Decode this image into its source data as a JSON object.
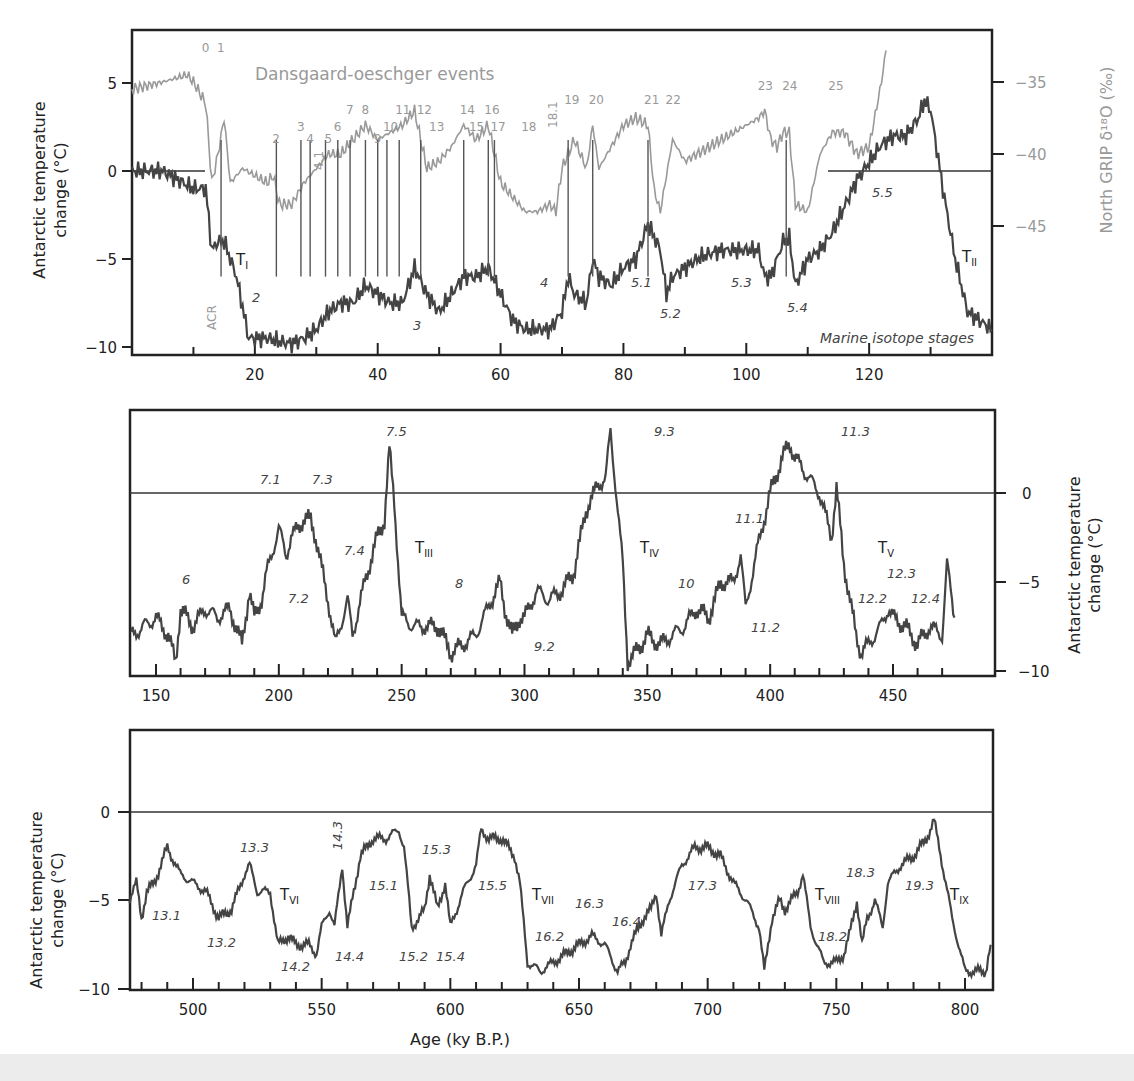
{
  "chart_data": [
    {
      "type": "line",
      "panel": "top",
      "title": "",
      "annotation_title": "Dansgaard-oeschger events",
      "xlabel": "",
      "ylabel": "Antarctic temperature change (°C)",
      "y2label": "North GRIP δ18O (‰)",
      "xlim": [
        0,
        140
      ],
      "ylim": [
        -10.5,
        8
      ],
      "y2lim": [
        -54,
        -30
      ],
      "xticks": [
        20,
        40,
        60,
        80,
        100,
        120
      ],
      "yticks": [
        5,
        0,
        -5,
        -10
      ],
      "y2ticks": [
        -35,
        -40,
        -45
      ],
      "series": [
        {
          "name": "Antarctic temperature",
          "color": "#444444",
          "x": [
            0,
            5,
            10,
            12,
            13,
            14,
            15,
            17,
            19,
            20,
            22,
            24,
            26,
            28,
            30,
            32,
            34,
            36,
            38,
            40,
            42,
            44,
            46,
            48,
            50,
            52,
            54,
            56,
            58,
            60,
            62,
            64,
            66,
            68,
            70,
            71,
            72,
            74,
            75,
            76,
            78,
            80,
            82,
            84,
            86,
            87,
            88,
            90,
            92,
            94,
            96,
            98,
            100,
            102,
            103,
            104,
            106,
            107,
            108,
            110,
            112,
            114,
            116,
            118,
            120,
            122,
            124,
            126,
            128,
            129,
            130,
            132,
            134,
            136,
            138,
            140
          ],
          "y": [
            0,
            0,
            -1,
            -1,
            -4.5,
            -4,
            -4,
            -6,
            -9.5,
            -9.5,
            -9.5,
            -9.7,
            -9.8,
            -9.5,
            -9,
            -8,
            -7.5,
            -7.5,
            -6.5,
            -7,
            -7.5,
            -7.5,
            -5.5,
            -7,
            -8,
            -7,
            -6,
            -6,
            -5.5,
            -7,
            -8.5,
            -9,
            -9,
            -9,
            -8,
            -6,
            -7,
            -7.5,
            -5,
            -6,
            -6.5,
            -5.5,
            -5,
            -3,
            -4.5,
            -7,
            -6,
            -5.5,
            -5,
            -4.7,
            -4.5,
            -4.5,
            -4.5,
            -4.5,
            -6,
            -6,
            -4,
            -3.8,
            -6.5,
            -5,
            -4.5,
            -3.5,
            -2,
            -0.5,
            0.5,
            1.5,
            2,
            2,
            3,
            4,
            3.5,
            -1,
            -5,
            -8,
            -8.5,
            -9
          ]
        },
        {
          "name": "North GRIP δ18O",
          "color": "#999999",
          "x": [
            0,
            5,
            9,
            10,
            12,
            13,
            14,
            15,
            16,
            18,
            20,
            22,
            23,
            24,
            26,
            28,
            30,
            32,
            34,
            36,
            38,
            40,
            42,
            44,
            46,
            48,
            50,
            52,
            54,
            56,
            58,
            60,
            62,
            64,
            66,
            68,
            69,
            70,
            72,
            74,
            75,
            76,
            78,
            80,
            82,
            84,
            85,
            86,
            88,
            90,
            92,
            94,
            96,
            98,
            100,
            102,
            103,
            104,
            105,
            106,
            107,
            108,
            110,
            112,
            114,
            116,
            118,
            120,
            122,
            123
          ],
          "y": [
            -35.5,
            -35,
            -34.5,
            -35,
            -36.5,
            -42,
            -40,
            -37.5,
            -42,
            -41,
            -41.5,
            -42,
            -41.5,
            -43.5,
            -43.5,
            -42,
            -41,
            -40,
            -40,
            -39,
            -38,
            -39,
            -38.5,
            -38,
            -37,
            -41,
            -40.5,
            -39.5,
            -38,
            -39,
            -38,
            -42,
            -43,
            -44,
            -44,
            -43.5,
            -44,
            -41,
            -39,
            -41,
            -38,
            -41,
            -39.5,
            -38,
            -37.5,
            -38,
            -42.5,
            -44,
            -39,
            -40.5,
            -40,
            -39.5,
            -39,
            -38.5,
            -38,
            -37.5,
            -37,
            -39,
            -39.5,
            -38.5,
            -38.5,
            -43.5,
            -44,
            -40,
            -38.5,
            -38.5,
            -40,
            -39.5,
            -35,
            -32
          ]
        }
      ],
      "annotations": {
        "do_events": [
          "0",
          "1",
          "2",
          "3",
          "4",
          "4.1",
          "5",
          "6",
          "7",
          "8",
          "9",
          "10",
          "11",
          "12",
          "13",
          "14",
          "15",
          "16",
          "17",
          "18",
          "18.1",
          "19",
          "20",
          "21",
          "22",
          "23",
          "24",
          "25"
        ],
        "marine_isotope_stages": [
          "2",
          "3",
          "4",
          "5.1",
          "5.2",
          "5.3",
          "5.4",
          "5.5"
        ],
        "terminations": [
          "TI",
          "TII"
        ],
        "other": [
          "ACR",
          "Marine isotope stages"
        ]
      }
    },
    {
      "type": "line",
      "panel": "middle",
      "xlabel": "",
      "ylabel": "Antarctic temperature change (°C)",
      "xlim": [
        140,
        475
      ],
      "ylim": [
        -10.5,
        4.5
      ],
      "xticks": [
        150,
        200,
        250,
        300,
        350,
        400,
        450
      ],
      "yticks": [
        0,
        -5,
        -10
      ],
      "series": [
        {
          "name": "Antarctic temperature",
          "color": "#444444",
          "x": [
            140,
            145,
            150,
            155,
            158,
            160,
            165,
            170,
            175,
            180,
            185,
            188,
            190,
            193,
            195,
            200,
            203,
            205,
            210,
            213,
            215,
            220,
            223,
            225,
            228,
            230,
            235,
            240,
            243,
            245,
            247,
            250,
            255,
            260,
            265,
            270,
            275,
            280,
            285,
            290,
            292,
            295,
            298,
            300,
            305,
            310,
            315,
            320,
            325,
            330,
            333,
            335,
            340,
            342,
            345,
            350,
            355,
            360,
            365,
            370,
            375,
            380,
            385,
            388,
            390,
            395,
            400,
            405,
            408,
            410,
            415,
            420,
            423,
            425,
            427,
            430,
            435,
            437,
            440,
            445,
            448,
            450,
            455,
            460,
            465,
            470,
            472,
            475
          ],
          "y": [
            -8,
            -7.5,
            -7,
            -8,
            -9.5,
            -6.5,
            -7.5,
            -6.5,
            -7,
            -6.5,
            -8.5,
            -5.5,
            -7,
            -6,
            -4.5,
            -2,
            -3.5,
            -2.5,
            -1.5,
            -1.5,
            -2.5,
            -6,
            -8.5,
            -7.5,
            -6,
            -8,
            -5,
            -2.5,
            -1.5,
            2.5,
            -0.5,
            -7,
            -7.5,
            -7.5,
            -7.5,
            -9,
            -8.5,
            -8,
            -6.5,
            -5,
            -6.5,
            -8,
            -7,
            -7,
            -5.5,
            -6,
            -5.5,
            -4.5,
            -1,
            0.5,
            0.8,
            3.5,
            -4,
            -9.5,
            -9,
            -8,
            -8.5,
            -8,
            -7.5,
            -6.5,
            -7,
            -5,
            -5,
            -3.5,
            -6.5,
            -3,
            0,
            2,
            2.8,
            2,
            1,
            0,
            -1.5,
            -2.5,
            0.3,
            -4,
            -8,
            -9,
            -8.5,
            -7.5,
            -6.5,
            -7,
            -7.5,
            -8.5,
            -7.5,
            -8,
            -4,
            -7
          ]
        }
      ],
      "annotations": {
        "marine_isotope_stages": [
          "6",
          "7.1",
          "7.2",
          "7.3",
          "7.4",
          "7.5",
          "8",
          "9.2",
          "9.3",
          "10",
          "11.1",
          "11.2",
          "11.3",
          "12.2",
          "12.3",
          "12.4"
        ],
        "terminations": [
          "TIII",
          "TIV",
          "TV"
        ]
      }
    },
    {
      "type": "line",
      "panel": "bottom",
      "xlabel": "Age (ky B.P.)",
      "ylabel": "Antarctic temperature change (°C)",
      "xlim": [
        475,
        810
      ],
      "ylim": [
        -10.5,
        4.5
      ],
      "xticks": [
        500,
        550,
        600,
        650,
        700,
        750,
        800
      ],
      "yticks": [
        0,
        -5,
        -10
      ],
      "series": [
        {
          "name": "Antarctic temperature",
          "color": "#444444",
          "x": [
            475,
            478,
            480,
            482,
            485,
            490,
            495,
            500,
            505,
            510,
            515,
            520,
            522,
            525,
            528,
            530,
            533,
            537,
            540,
            545,
            548,
            550,
            553,
            555,
            558,
            560,
            565,
            570,
            575,
            580,
            582,
            585,
            588,
            590,
            592,
            595,
            598,
            600,
            605,
            610,
            612,
            615,
            620,
            625,
            627,
            630,
            635,
            640,
            645,
            650,
            655,
            660,
            665,
            668,
            670,
            675,
            678,
            680,
            682,
            685,
            690,
            695,
            700,
            705,
            710,
            715,
            720,
            722,
            725,
            728,
            730,
            735,
            737,
            740,
            745,
            750,
            753,
            755,
            758,
            760,
            762,
            765,
            768,
            770,
            775,
            780,
            785,
            788,
            790,
            795,
            800,
            805,
            808,
            810
          ],
          "y": [
            -5,
            -4,
            -6,
            -4.5,
            -4,
            -2,
            -3.5,
            -4,
            -4.5,
            -6,
            -5.5,
            -3.5,
            -3,
            -4.5,
            -4.5,
            -4.5,
            -7.5,
            -7,
            -7.5,
            -7.5,
            -8,
            -6.5,
            -5.5,
            -6.5,
            -3,
            -6.5,
            -2.5,
            -1.5,
            -1.5,
            -1,
            -2,
            -6.5,
            -6,
            -5.5,
            -3.5,
            -5.5,
            -4,
            -6.5,
            -4.5,
            -3,
            -1,
            -1.5,
            -1.5,
            -2.5,
            -4,
            -8.5,
            -9,
            -8.5,
            -8,
            -7.5,
            -7,
            -7.5,
            -9,
            -8.5,
            -7.5,
            -6,
            -5.5,
            -4.5,
            -7,
            -5,
            -3,
            -2,
            -2,
            -2.5,
            -4,
            -5,
            -6.5,
            -9,
            -6,
            -5,
            -5.5,
            -4.5,
            -3.5,
            -6.5,
            -8.5,
            -8.5,
            -8,
            -7,
            -5,
            -7.5,
            -6,
            -5,
            -6.5,
            -4,
            -3,
            -2.5,
            -1.5,
            -0.5,
            -2,
            -6,
            -9,
            -9,
            -9,
            -7.5
          ]
        }
      ],
      "annotations": {
        "marine_isotope_stages": [
          "13.1",
          "13.2",
          "13.3",
          "14.2",
          "14.3",
          "14.4",
          "15.1",
          "15.2",
          "15.3",
          "15.4",
          "15.5",
          "16.2",
          "16.3",
          "16.4",
          "17.3",
          "18.2",
          "18.3",
          "19.3"
        ],
        "terminations": [
          "TVI",
          "TVII",
          "TVIII",
          "TIX"
        ]
      }
    }
  ],
  "labels": {
    "do_title": "Dansgaard-oeschger events",
    "ylabel_line1": "Antarctic temperature",
    "ylabel_line2": "change (°C)",
    "y2label": "North GRIP δ¹⁸O (‰)",
    "xlabel": "Age (ky B.P.)",
    "acr": "ACR",
    "mis_caption": "Marine isotope stages"
  },
  "colors": {
    "antarctic": "#444444",
    "grip": "#999999",
    "frame": "#222222"
  }
}
